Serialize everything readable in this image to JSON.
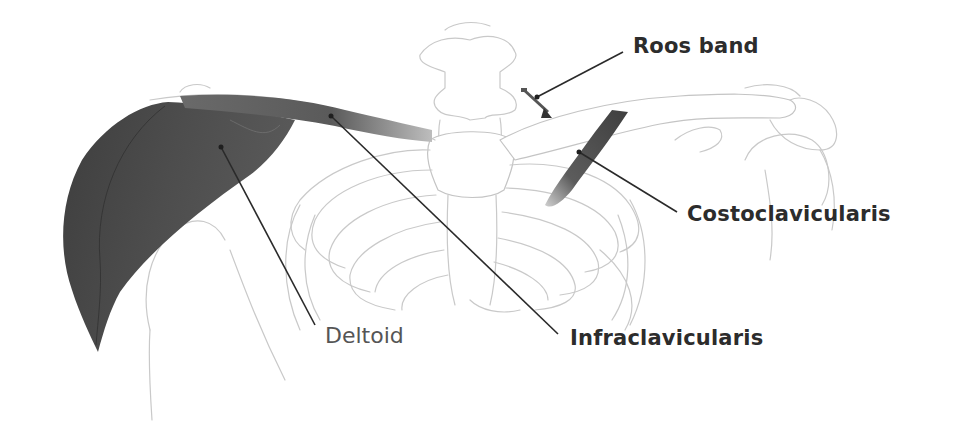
{
  "figure": {
    "type": "anatomical illustration",
    "colors": {
      "background": "#ffffff",
      "muscle_dark": "#4a4a4a",
      "muscle_mid": "#6e6e6e",
      "bone_outline": "#c9c9c9",
      "label_text": "#2c2c2c",
      "leader_line": "#2a2a2a"
    }
  },
  "labels": {
    "roos_band": "Roos band",
    "costoclavicularis": "Costoclavicularis",
    "infraclavicularis": "Infraclavicularis",
    "deltoid": "Deltoid"
  }
}
